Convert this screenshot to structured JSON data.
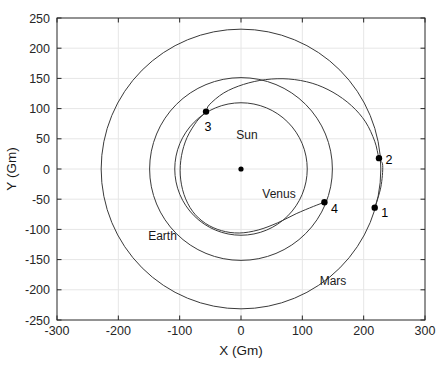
{
  "chart_data": {
    "type": "scatter",
    "title": "",
    "xlabel": "X (Gm)",
    "ylabel": "Y (Gm)",
    "xlim": [
      -300,
      300
    ],
    "ylim": [
      -250,
      250
    ],
    "xticks": [
      -300,
      -200,
      -100,
      0,
      100,
      200,
      300
    ],
    "yticks": [
      -250,
      -200,
      -150,
      -100,
      -50,
      0,
      50,
      100,
      150,
      200,
      250
    ],
    "xticklabels": [
      "-300",
      "-200",
      "-100",
      "0",
      "100",
      "200",
      "300"
    ],
    "yticklabels": [
      "-250",
      "-200",
      "-150",
      "-100",
      "-50",
      "0",
      "50",
      "100",
      "150",
      "200",
      "250"
    ],
    "grid": true,
    "legend": "none",
    "units": "Gm",
    "orbits": [
      {
        "name": "Venus",
        "radius": 108,
        "cx": 0,
        "cy": 0,
        "label": "Venus",
        "label_x": 62,
        "label_y": -48
      },
      {
        "name": "Earth",
        "radius": 149,
        "cx": 0,
        "cy": 0,
        "label": "Earth",
        "label_x": -128,
        "label_y": -118
      },
      {
        "name": "Mars",
        "radius": 228,
        "cx": 0,
        "cy": 0,
        "label": "Mars",
        "label_x": 150,
        "label_y": -192
      }
    ],
    "trajectory": {
      "name": "transfer-trajectory",
      "description": "spiral transfer arc from Mars orbit inward to Venus orbit",
      "points_xy": [
        [
          218,
          -64
        ],
        [
          228,
          -30
        ],
        [
          231,
          6
        ],
        [
          225,
          18
        ],
        [
          218,
          46
        ],
        [
          203,
          78
        ],
        [
          180,
          105
        ],
        [
          150,
          127
        ],
        [
          116,
          142
        ],
        [
          78,
          149
        ],
        [
          40,
          148
        ],
        [
          4,
          140
        ],
        [
          -28,
          126
        ],
        [
          -52,
          106
        ],
        [
          -57,
          95
        ],
        [
          -72,
          79
        ],
        [
          -88,
          52
        ],
        [
          -97,
          22
        ],
        [
          -99,
          -10
        ],
        [
          -93,
          -42
        ],
        [
          -79,
          -70
        ],
        [
          -58,
          -90
        ],
        [
          -32,
          -102
        ],
        [
          -3,
          -106
        ],
        [
          28,
          -101
        ],
        [
          60,
          -89
        ],
        [
          90,
          -74
        ],
        [
          118,
          -62
        ],
        [
          136,
          -55
        ]
      ]
    },
    "markers": [
      {
        "label": "1",
        "x": 218,
        "y": -64,
        "label_dx": 10,
        "label_dy": 9
      },
      {
        "label": "2",
        "x": 225,
        "y": 18,
        "label_dx": 10,
        "label_dy": 6
      },
      {
        "label": "3",
        "x": -57,
        "y": 95,
        "label_dx": 2,
        "label_dy": 19
      },
      {
        "label": "4",
        "x": 136,
        "y": -55,
        "label_dx": 10,
        "label_dy": 11
      }
    ],
    "center_body": {
      "label": "Sun",
      "x": 0,
      "y": 0,
      "label_dx": 6,
      "label_dy": 30
    },
    "colors": {
      "background": "#ffffff",
      "axis": "#262626",
      "grid": "#e6e6e6",
      "orbit_line": "#3a3a3a",
      "marker": "#000000",
      "text": "#1a1a1a"
    }
  }
}
